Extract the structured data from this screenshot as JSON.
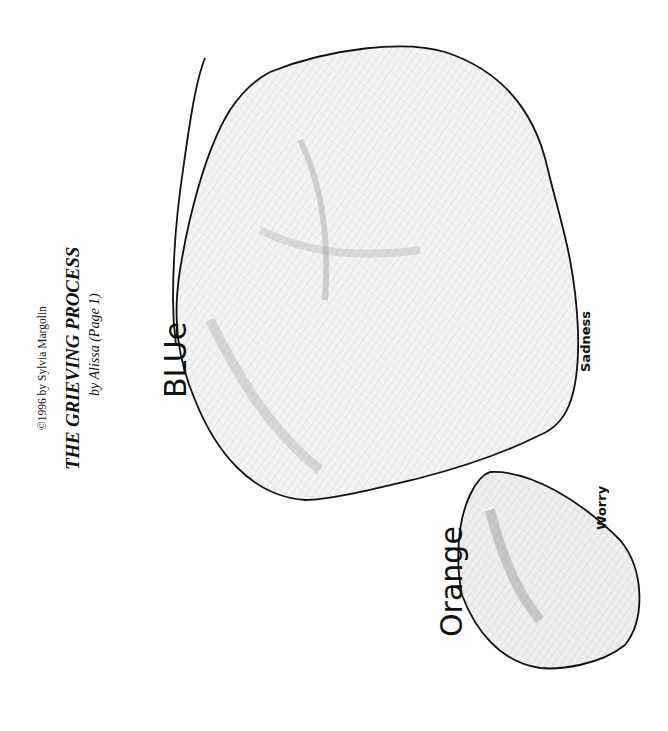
{
  "header": {
    "copyright": "©1996 by Sylvia Margolin",
    "title": "THE GRIEVING PROCESS",
    "subtitle": "by Alissa (Page 1)"
  },
  "drawing": {
    "large_shape": {
      "color_label": "Blue",
      "color_label_as_written": "BLUe",
      "emotion_label": "Sadness"
    },
    "small_shape": {
      "color_label": "Orange",
      "emotion_label": "Worry"
    }
  }
}
